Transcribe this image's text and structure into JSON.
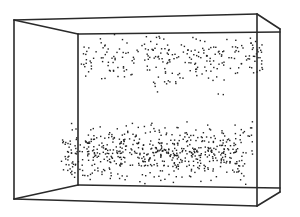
{
  "figure": {
    "width": 300,
    "height": 217,
    "background": "#ffffff",
    "line_color": "#2a2a2a",
    "dot_color": "#222222",
    "box": {
      "edges": [
        {
          "name": "front-left-edge",
          "x1": 14,
          "y1": 20,
          "x2": 14,
          "y2": 199
        },
        {
          "name": "top-outer-edge",
          "x1": 14,
          "y1": 20,
          "x2": 257,
          "y2": 14
        },
        {
          "name": "top-outer-edge-right",
          "x1": 257,
          "y1": 14,
          "x2": 280,
          "y2": 29
        },
        {
          "name": "top-back-edge",
          "x1": 78,
          "y1": 34,
          "x2": 280,
          "y2": 32
        },
        {
          "name": "top-left-diagonal",
          "x1": 14,
          "y1": 20,
          "x2": 78,
          "y2": 34
        },
        {
          "name": "back-left-edge",
          "x1": 78,
          "y1": 34,
          "x2": 78,
          "y2": 185
        },
        {
          "name": "back-right-edge",
          "x1": 257,
          "y1": 14,
          "x2": 257,
          "y2": 206
        },
        {
          "name": "front-right-edge",
          "x1": 280,
          "y1": 29,
          "x2": 280,
          "y2": 192
        },
        {
          "name": "bottom-back-edge",
          "x1": 78,
          "y1": 185,
          "x2": 280,
          "y2": 188
        },
        {
          "name": "bottom-left-diagonal",
          "x1": 14,
          "y1": 199,
          "x2": 78,
          "y2": 185
        },
        {
          "name": "bottom-outer-edge",
          "x1": 14,
          "y1": 199,
          "x2": 257,
          "y2": 206
        },
        {
          "name": "bottom-right-diagonal",
          "x1": 257,
          "y1": 206,
          "x2": 280,
          "y2": 192
        }
      ]
    },
    "point_clusters": [
      {
        "name": "upper-band",
        "x_min": 80,
        "x_max": 262,
        "y_min": 33,
        "y_max": 82,
        "count": 230,
        "seed": 7
      },
      {
        "name": "upper-sparse-tail",
        "x_min": 150,
        "x_max": 240,
        "y_min": 60,
        "y_max": 100,
        "count": 25,
        "seed": 11
      },
      {
        "name": "lower-band",
        "x_min": 60,
        "x_max": 252,
        "y_min": 118,
        "y_max": 186,
        "count": 420,
        "seed": 23
      },
      {
        "name": "lower-dense-core",
        "x_min": 85,
        "x_max": 230,
        "y_min": 128,
        "y_max": 178,
        "count": 180,
        "seed": 41
      }
    ]
  }
}
